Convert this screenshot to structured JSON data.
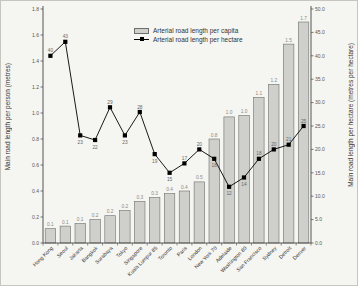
{
  "figure": {
    "background": "#f5f5f1",
    "bar_fill": "#cfcfcb",
    "bar_stroke": "#6e6e6e",
    "line_color": "#000000",
    "axis_color": "#444444",
    "tick_label_color": "#555555",
    "category_label_color": "#333333",
    "value_label_color": "#8a8a8a",
    "marker_label_color": "#666666"
  },
  "chart_data": {
    "type": "bar-line",
    "categories": [
      "Hong Kong",
      "Seoul",
      "Jakarta",
      "Bangkok",
      "Surabaya",
      "Tokyo",
      "Singapore",
      "Kuala Lumpur 85",
      "Toronto",
      "Paris",
      "London",
      "New York 70",
      "Adelaide",
      "Washington 80",
      "San Francisco",
      "Sydney",
      "Detroit",
      "Denver"
    ],
    "series": [
      {
        "name": "Arterial road length per capita",
        "type": "bar",
        "axis": "left",
        "heights": [
          0.11,
          0.13,
          0.15,
          0.18,
          0.21,
          0.25,
          0.32,
          0.35,
          0.38,
          0.4,
          0.47,
          0.8,
          0.97,
          0.98,
          1.12,
          1.22,
          1.53,
          1.7
        ],
        "labels": [
          "0.1",
          "0.1",
          "0.1",
          "0.2",
          "0.2",
          "0.2",
          "0.3",
          "0.3",
          "0.4",
          "0.4",
          "0.5",
          "0.8",
          "1.0",
          "1.0",
          "1.1",
          "1.2",
          "1.5",
          "1.7"
        ]
      },
      {
        "name": "Arterial road length per hectare",
        "type": "line",
        "axis": "right",
        "values": [
          40,
          43,
          23,
          22,
          29,
          23,
          28,
          19,
          15,
          17,
          20,
          18,
          12,
          14,
          18,
          20,
          21,
          25
        ],
        "labels": [
          "40",
          "43",
          "23",
          "22",
          "29",
          "23",
          "28",
          "19",
          "15",
          "17",
          "20",
          "18",
          "12",
          "14",
          "18",
          "20",
          "21",
          "25"
        ],
        "label_side": [
          "above",
          "above",
          "below",
          "below",
          "above",
          "below",
          "above",
          "below",
          "below",
          "above",
          "above",
          "below",
          "below",
          "below",
          "above",
          "above",
          "above",
          "above"
        ]
      }
    ],
    "left_axis": {
      "label": "Main road length per person (metres)",
      "min": 0,
      "max": 1.8,
      "step": 0.2
    },
    "right_axis": {
      "label": "Main road length per hectare (metres per hectare)",
      "min": 0,
      "max": 50,
      "step": 5
    },
    "legend_position": "top-center",
    "grid": "off",
    "title": ""
  }
}
